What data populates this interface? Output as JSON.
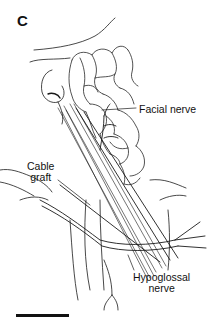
{
  "figure": {
    "panel_letter": "C",
    "labels": {
      "facial_nerve": "Facial nerve",
      "cable_graft_line1": "Cable",
      "cable_graft_line2": "graft",
      "hypoglossal_line1": "Hypoglossal",
      "hypoglossal_line2": "nerve"
    },
    "scale_bar": {
      "present": true
    },
    "colors": {
      "ink": "#111111",
      "background": "#ffffff"
    }
  }
}
